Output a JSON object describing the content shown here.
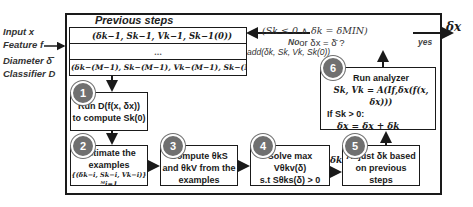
{
  "inputs": {
    "input": "Input x",
    "feature": "Feature f",
    "diameter": "Diameter δ̄",
    "classifier": "Classifier D"
  },
  "previous_steps": {
    "title": "Previous steps",
    "rows": [
      "(δk−1, Sk−1, Vk−1, Sk−1(0))",
      "…",
      "(δk−(M−1), Sk−(M−1), Vk−(M−1), Sk−(M−1)(0))"
    ]
  },
  "decision": {
    "line1": "(Sk ≤ 0 ∧ δk = δMIN)",
    "line2": "or δx = δ̄ ?",
    "no_label": "No",
    "yes_label": "yes",
    "add_label": "add(δk, Sk, Vk, Sk(0))"
  },
  "output": {
    "label": "δx"
  },
  "steps": [
    {
      "number": "1",
      "line1": "Run D(f(x, δx))",
      "line2": "to compute Sk(0)"
    },
    {
      "number": "2",
      "line1": "Estimate the",
      "line2": "examples",
      "line3": "{(δk−i, Sk−i, Vk−i)}ᴹi=1"
    },
    {
      "number": "3",
      "line1": "Compute θkS",
      "line2": "and θkV from the",
      "line3": "examples"
    },
    {
      "number": "4",
      "line1": "Solve max Vθkv(δ)",
      "line2": "s.t Sθks(δ) > 0",
      "edge_label": "δk"
    },
    {
      "number": "5",
      "line1": "Adjust δk based",
      "line2": "on previous steps"
    },
    {
      "number": "6",
      "line1": "Run analyzer",
      "line2": "Sk, Vk = A(If,δx(f(x, δx)))",
      "line3": "If Sk > 0:",
      "line4": "δx = δx + δk"
    }
  ],
  "colors": {
    "circle": "#707070",
    "stroke": "#1a1a1a"
  }
}
